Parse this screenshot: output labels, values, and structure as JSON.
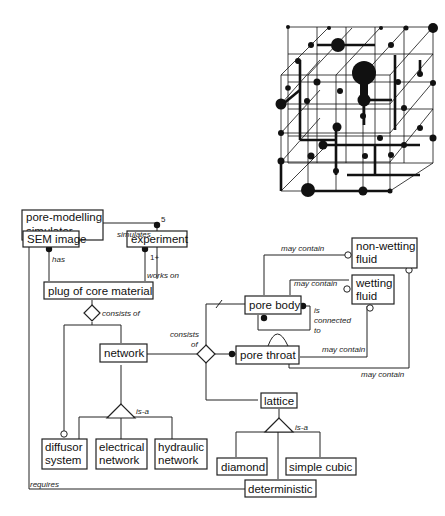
{
  "entities": {
    "simulator": [
      "pore-modelling",
      "simulator"
    ],
    "sem_image": "SEM image",
    "experiment": "experiment",
    "plug": "plug of core material",
    "network": "network",
    "pore_body": "pore body",
    "pore_throat": "pore throat",
    "non_wetting": [
      "non-wetting",
      "fluid"
    ],
    "wetting": [
      "wetting",
      "fluid"
    ],
    "lattice": "lattice",
    "diffusor": [
      "diffusor",
      "system"
    ],
    "electrical": [
      "electrical",
      "network"
    ],
    "hydraulic": [
      "hydraulic",
      "network"
    ],
    "diamond": "diamond",
    "simple_cubic": "simple cubic",
    "deterministic": "deterministic"
  },
  "relations": {
    "simulates": "simulates",
    "five": "5",
    "has": "has",
    "one_plus": "1+",
    "works_on": "works on",
    "consists_of_plug": "consists of",
    "consists_network": "consists",
    "of_network": "of",
    "may_contain_1": "may contain",
    "may_contain_2": "may contain",
    "may_contain_3": "may contain",
    "may_contain_4": "may contain",
    "is": "is",
    "connected": "connected",
    "to": "to",
    "is_a_network": "is-a",
    "is_a_lattice": "is-a",
    "requires": "requires"
  }
}
